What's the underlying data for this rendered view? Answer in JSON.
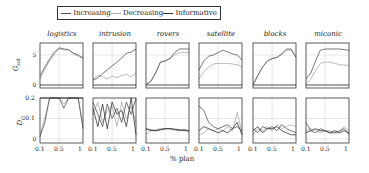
{
  "chart_data": {
    "type": "line",
    "legend": [
      {
        "name": "Increasing",
        "color": "#555555"
      },
      {
        "name": "Decreasing",
        "color": "#aaaaaa"
      },
      {
        "name": "Informative",
        "color": "#333333"
      }
    ],
    "xlabel": "% plan",
    "x_ticks": [
      "0.1",
      "0.5",
      "1"
    ],
    "x": [
      0.1,
      0.2,
      0.3,
      0.4,
      0.5,
      0.6,
      0.7,
      0.8,
      0.9,
      1.0
    ],
    "rows": [
      {
        "ylabel": "G_sat",
        "ylabel_main": "G",
        "ylabel_sub": "sat",
        "y_ticks": [
          "0",
          "5"
        ],
        "ylim": [
          -0.5,
          7
        ]
      },
      {
        "ylabel": "D_G",
        "ylabel_main": "D",
        "ylabel_sub": "G",
        "y_ticks": [
          "0",
          "0.1",
          "0.2"
        ],
        "ylim": [
          -0.02,
          0.2
        ]
      }
    ],
    "panels": [
      {
        "title": "logistics",
        "gsat": {
          "Increasing": [
            1.5,
            3.0,
            4.3,
            5.4,
            6.2,
            6.0,
            5.9,
            5.3,
            5.0,
            4.5
          ],
          "Decreasing": [
            1.0,
            2.6,
            4.0,
            5.1,
            6.0,
            5.9,
            5.8,
            5.2,
            4.8,
            4.4
          ],
          "Informative": [
            0,
            0,
            0,
            0,
            0,
            0,
            0,
            0,
            0,
            0
          ]
        },
        "dg": {
          "Increasing": [
            0.01,
            0.08,
            0.2,
            0.2,
            0.2,
            0.15,
            0.2,
            0.2,
            0.2,
            0.05
          ],
          "Decreasing": [
            0.02,
            0.1,
            0.2,
            0.2,
            0.2,
            0.17,
            0.2,
            0.2,
            0.2,
            0.06
          ],
          "Informative": [
            0.2,
            0.2,
            0.2,
            0.2,
            0.2,
            0.2,
            0.2,
            0.2,
            0.2,
            0.2
          ]
        }
      },
      {
        "title": "intrusion",
        "gsat": {
          "Increasing": [
            0.8,
            1.2,
            1.9,
            2.5,
            3.2,
            3.8,
            4.5,
            5.3,
            5.5,
            6.0
          ],
          "Decreasing": [
            1.0,
            1.6,
            1.4,
            1.0,
            1.5,
            1.2,
            1.6,
            1.8,
            1.4,
            2.0
          ],
          "Informative": [
            0,
            0,
            0,
            0,
            0,
            0,
            0,
            0,
            0,
            0
          ]
        },
        "dg": {
          "Increasing": [
            0.18,
            0.12,
            0.06,
            0.17,
            0.1,
            0.15,
            0.08,
            0.18,
            0.12,
            0.2
          ],
          "Decreasing": [
            0.12,
            0.18,
            0.08,
            0.14,
            0.16,
            0.06,
            0.18,
            0.1,
            0.16,
            0.08
          ],
          "Informative": [
            0.15,
            0.06,
            0.17,
            0.05,
            0.18,
            0.12,
            0.14,
            0.06,
            0.2,
            0.02
          ]
        }
      },
      {
        "title": "rovers",
        "gsat": {
          "Increasing": [
            0.1,
            0.6,
            2.0,
            3.8,
            4.0,
            4.4,
            5.4,
            6.0,
            6.0,
            6.0
          ],
          "Decreasing": [
            0.1,
            0.6,
            2.0,
            3.8,
            4.0,
            4.4,
            5.0,
            5.4,
            5.4,
            5.4
          ],
          "Informative": [
            0,
            0,
            0,
            0,
            0,
            0,
            0,
            0,
            0,
            0
          ]
        },
        "dg": {
          "Increasing": [
            0.05,
            0.045,
            0.04,
            0.045,
            0.05,
            0.05,
            0.045,
            0.04,
            0.045,
            0.04
          ],
          "Decreasing": [
            0.02,
            0.04,
            0.045,
            0.05,
            0.05,
            0.05,
            0.045,
            0.04,
            0.045,
            0.035
          ],
          "Informative": [
            0.05,
            0.04,
            0.04,
            0.045,
            0.05,
            0.05,
            0.048,
            0.045,
            0.04,
            0.04
          ]
        }
      },
      {
        "title": "satellite",
        "gsat": {
          "Increasing": [
            2.5,
            4.0,
            4.8,
            5.0,
            5.4,
            5.8,
            5.5,
            5.2,
            5.0,
            4.2
          ],
          "Decreasing": [
            1.0,
            2.2,
            3.0,
            3.5,
            3.6,
            3.6,
            3.6,
            3.5,
            3.4,
            3.0
          ],
          "Informative": [
            0,
            0,
            0,
            0,
            0,
            0,
            0,
            0,
            0,
            0
          ]
        },
        "dg": {
          "Increasing": [
            0.16,
            0.14,
            0.08,
            0.06,
            0.05,
            0.06,
            0.07,
            0.05,
            0.06,
            0.04
          ],
          "Decreasing": [
            0.02,
            0.03,
            0.05,
            0.04,
            0.05,
            0.04,
            0.06,
            0.04,
            0.13,
            0.03
          ],
          "Informative": [
            0.04,
            0.06,
            0.05,
            0.04,
            0.03,
            0.04,
            0.03,
            0.05,
            0.08,
            0.02
          ]
        }
      },
      {
        "title": "blocks",
        "gsat": {
          "Increasing": [
            0,
            1.6,
            3.0,
            4.0,
            4.4,
            4.6,
            5.2,
            6.0,
            6.0,
            4.6
          ],
          "Decreasing": [
            0,
            1.6,
            3.0,
            4.0,
            4.4,
            4.6,
            5.0,
            5.8,
            5.8,
            4.6
          ],
          "Informative": [
            0,
            0,
            0,
            0,
            0,
            0,
            0,
            0,
            0,
            0
          ]
        },
        "dg": {
          "Increasing": [
            0.05,
            0.03,
            0.06,
            0.05,
            0.06,
            0.04,
            0.07,
            0.05,
            0.04,
            0.03
          ],
          "Decreasing": [
            0.02,
            0.05,
            0.04,
            0.06,
            0.04,
            0.07,
            0.05,
            0.06,
            0.07,
            0.06
          ],
          "Informative": [
            0.04,
            0.06,
            0.03,
            0.05,
            0.05,
            0.06,
            0.04,
            0.03,
            0.02,
            0.02
          ]
        }
      },
      {
        "title": "miconic",
        "gsat": {
          "Increasing": [
            1.0,
            2.0,
            4.0,
            5.8,
            6.0,
            6.0,
            6.0,
            6.0,
            5.9,
            5.8
          ],
          "Decreasing": [
            0.2,
            1.0,
            2.4,
            3.6,
            3.8,
            3.8,
            3.6,
            3.4,
            3.3,
            3.3
          ],
          "Informative": [
            0,
            0,
            0,
            0,
            0,
            0,
            0,
            0,
            0,
            0
          ]
        },
        "dg": {
          "Increasing": [
            0.08,
            0.04,
            0.03,
            0.05,
            0.04,
            0.03,
            0.03,
            0.04,
            0.05,
            0.02
          ],
          "Decreasing": [
            0.04,
            0.05,
            0.04,
            0.03,
            0.04,
            0.04,
            0.03,
            0.03,
            0.06,
            0.04
          ],
          "Informative": [
            0.03,
            0.04,
            0.05,
            0.04,
            0.04,
            0.03,
            0.04,
            0.03,
            0.04,
            0.03
          ]
        }
      }
    ]
  }
}
